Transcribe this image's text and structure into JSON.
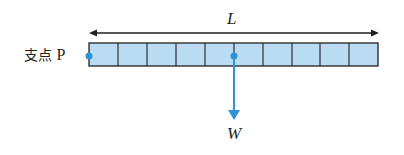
{
  "diagram": {
    "length_label": "L",
    "pivot_label": "支点",
    "pivot_point": "P",
    "weight_label": "W",
    "segments": 10,
    "colors": {
      "beam_fill": "#b9dcf2",
      "beam_stroke": "#231f20",
      "accent": "#2f93d6",
      "arrow": "#231f20"
    }
  }
}
